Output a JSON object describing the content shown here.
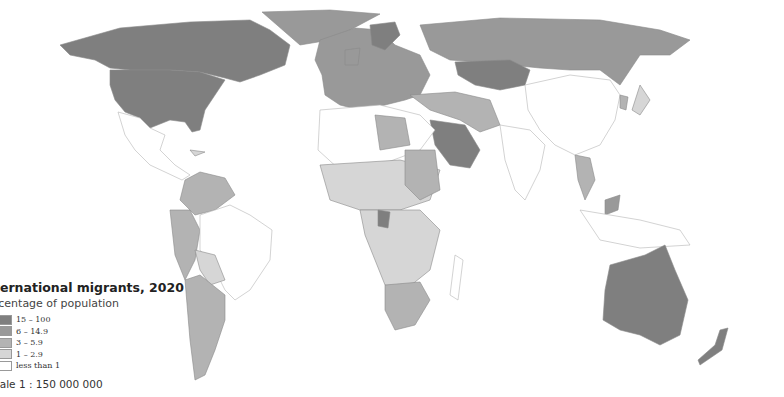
{
  "map": {
    "title": "International migrants, 2020",
    "title_visible": "ternational migrants, 2020",
    "subtitle": "Percentage of population",
    "subtitle_visible": "rcentage of population",
    "scale": "Scale 1 : 150 000 000",
    "scale_visible": "cale 1 : 150 000 000",
    "legend": [
      {
        "label": "15 – 100",
        "color": "#7f7f7f"
      },
      {
        "label": "6 – 14.9",
        "color": "#999999"
      },
      {
        "label": "3 – 5.9",
        "color": "#b3b3b3"
      },
      {
        "label": "1 – 2.9",
        "color": "#d6d6d6"
      },
      {
        "label": "less than 1",
        "color": "#ffffff"
      }
    ],
    "colors": {
      "border": "#8a8a8a",
      "outline": "#b5b5b5"
    }
  }
}
